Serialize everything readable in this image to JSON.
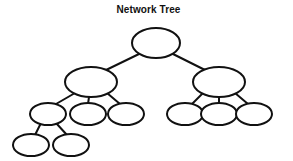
{
  "diagram": {
    "title": "Network Tree",
    "type": "tree",
    "background_color": "#ffffff",
    "stroke_color": "#111111",
    "node_fill_color": "#ffffff",
    "node_shape": "ellipse",
    "edge_style": "straight-line",
    "stroke_width": 2,
    "levels": 4,
    "node_count": 12,
    "edge_count": 11,
    "nodes": [
      {
        "id": "root",
        "label": "",
        "level": 0,
        "cx": 156,
        "cy": 43,
        "rx": 24,
        "ry": 15
      },
      {
        "id": "l1",
        "label": "",
        "level": 1,
        "cx": 91,
        "cy": 82,
        "rx": 26,
        "ry": 15
      },
      {
        "id": "r1",
        "label": "",
        "level": 1,
        "cx": 219,
        "cy": 82,
        "rx": 26,
        "ry": 15
      },
      {
        "id": "l2a",
        "label": "",
        "level": 2,
        "cx": 48,
        "cy": 114,
        "rx": 18,
        "ry": 11
      },
      {
        "id": "l2b",
        "label": "",
        "level": 2,
        "cx": 88,
        "cy": 114,
        "rx": 18,
        "ry": 11
      },
      {
        "id": "l2c",
        "label": "",
        "level": 2,
        "cx": 126,
        "cy": 114,
        "rx": 18,
        "ry": 11
      },
      {
        "id": "r2a",
        "label": "",
        "level": 2,
        "cx": 185,
        "cy": 114,
        "rx": 18,
        "ry": 11
      },
      {
        "id": "r2b",
        "label": "",
        "level": 2,
        "cx": 219,
        "cy": 114,
        "rx": 18,
        "ry": 11
      },
      {
        "id": "r2c",
        "label": "",
        "level": 2,
        "cx": 254,
        "cy": 114,
        "rx": 18,
        "ry": 11
      },
      {
        "id": "l3a",
        "label": "",
        "level": 3,
        "cx": 31,
        "cy": 145,
        "rx": 18,
        "ry": 11
      },
      {
        "id": "l3b",
        "label": "",
        "level": 3,
        "cx": 71,
        "cy": 145,
        "rx": 18,
        "ry": 11
      }
    ],
    "edges": [
      {
        "from": "root",
        "to": "l1",
        "x1": 139,
        "y1": 54,
        "x2": 104,
        "y2": 71
      },
      {
        "from": "root",
        "to": "r1",
        "x1": 173,
        "y1": 54,
        "x2": 207,
        "y2": 71
      },
      {
        "from": "l1",
        "to": "l2a",
        "x1": 75,
        "y1": 93,
        "x2": 56,
        "y2": 104
      },
      {
        "from": "l1",
        "to": "l2b",
        "x1": 89,
        "y1": 97,
        "x2": 88,
        "y2": 104
      },
      {
        "from": "l1",
        "to": "l2c",
        "x1": 107,
        "y1": 93,
        "x2": 120,
        "y2": 104
      },
      {
        "from": "r1",
        "to": "r2a",
        "x1": 203,
        "y1": 93,
        "x2": 192,
        "y2": 104
      },
      {
        "from": "r1",
        "to": "r2b",
        "x1": 219,
        "y1": 97,
        "x2": 219,
        "y2": 104
      },
      {
        "from": "r1",
        "to": "r2c",
        "x1": 235,
        "y1": 93,
        "x2": 248,
        "y2": 104
      },
      {
        "from": "l2a",
        "to": "l3a",
        "x1": 41,
        "y1": 123,
        "x2": 35,
        "y2": 135
      },
      {
        "from": "l2a",
        "to": "l3b",
        "x1": 56,
        "y1": 123,
        "x2": 67,
        "y2": 135
      }
    ]
  }
}
